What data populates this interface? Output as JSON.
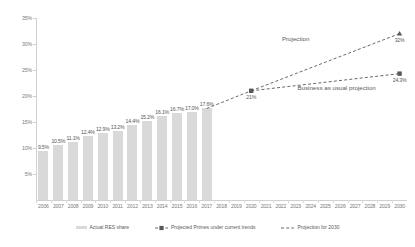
{
  "chart_data": {
    "type": "bar",
    "title": "",
    "xlabel": "",
    "ylabel": "",
    "ylim": [
      0,
      35
    ],
    "grid": false,
    "legend_position": "bottom",
    "categories": [
      "2006",
      "2007",
      "2008",
      "2009",
      "2010",
      "2011",
      "2012",
      "2013",
      "2014",
      "2015",
      "2016",
      "2017",
      "2018",
      "2019",
      "2020",
      "2021",
      "2022",
      "2023",
      "2024",
      "2025",
      "2026",
      "2027",
      "2028",
      "2029",
      "2030"
    ],
    "ytick_labels": [
      "35%",
      "30%",
      "25%",
      "20%",
      "15%",
      "10%",
      "5%"
    ],
    "ytick_values": [
      35,
      30,
      25,
      20,
      15,
      10,
      5
    ],
    "series": [
      {
        "name": "Actual RES share",
        "type": "bar",
        "color": "#d9d9d9",
        "points": [
          {
            "x": "2006",
            "value": 9.5,
            "label": "9.5%"
          },
          {
            "x": "2007",
            "value": 10.5,
            "label": "10.5%"
          },
          {
            "x": "2008",
            "value": 11.1,
            "label": "11.1%"
          },
          {
            "x": "2009",
            "value": 12.4,
            "label": "12.4%"
          },
          {
            "x": "2010",
            "value": 12.9,
            "label": "12.9%"
          },
          {
            "x": "2011",
            "value": 13.2,
            "label": "13.2%"
          },
          {
            "x": "2012",
            "value": 14.4,
            "label": "14.4%"
          },
          {
            "x": "2013",
            "value": 15.2,
            "label": "15.2%"
          },
          {
            "x": "2014",
            "value": 16.1,
            "label": "16.1%"
          },
          {
            "x": "2015",
            "value": 16.7,
            "label": "16.7%"
          },
          {
            "x": "2016",
            "value": 17.0,
            "label": "17.0%"
          },
          {
            "x": "2017",
            "value": 17.6,
            "label": "17.6%"
          }
        ]
      },
      {
        "name": "Projected Primes under current trends",
        "type": "line",
        "style": "dashed",
        "marker": "square",
        "color": "#58585a",
        "points": [
          {
            "x": "2017",
            "value": 17.6,
            "label": ""
          },
          {
            "x": "2020",
            "value": 21.0,
            "label": "21%"
          },
          {
            "x": "2030",
            "value": 24.3,
            "label": "24.3%"
          }
        ]
      },
      {
        "name": "Projection for 2030",
        "type": "line",
        "style": "dashed",
        "marker": "triangle",
        "color": "#58585a",
        "points": [
          {
            "x": "2020",
            "value": 21.0,
            "label": ""
          },
          {
            "x": "2030",
            "value": 32.0,
            "label": "32%"
          }
        ]
      }
    ],
    "annotations": [
      {
        "text": "Projection",
        "x": "2023",
        "value": 31.0
      },
      {
        "text": "Business as usual projection",
        "x": "2025",
        "value": 21.5
      }
    ]
  },
  "legend": {
    "items": [
      {
        "label": "Actual RES share",
        "marker": "bar-swatch"
      },
      {
        "label": "Projected Primes under current trends",
        "marker": "dashed-square"
      },
      {
        "label": "Projection for 2030",
        "marker": "dashed-triangle"
      }
    ]
  }
}
